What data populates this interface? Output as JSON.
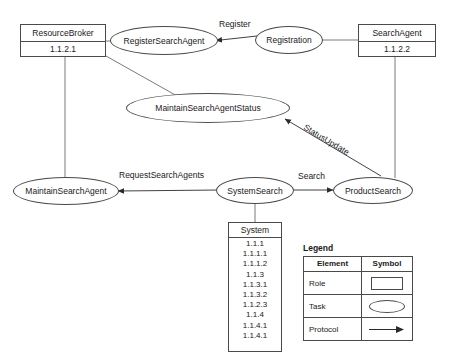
{
  "diagram": {
    "background_color": "#ffffff",
    "line_color": "#4a4a4a",
    "text_color": "#1a1a1a"
  },
  "roles": [
    {
      "name": "ResourceBroker",
      "id": "1.1.2.1"
    },
    {
      "name": "SearchAgent",
      "id": "1.1.2.2"
    }
  ],
  "tasks": [
    {
      "label": "RegisterSearchAgent"
    },
    {
      "label": "Registration"
    },
    {
      "label": "MaintainSearchAgentStatus"
    },
    {
      "label": "MaintainSearchAgent"
    },
    {
      "label": "SystemSearch"
    },
    {
      "label": "ProductSearch"
    }
  ],
  "protocols": [
    {
      "label": "Register",
      "from": "Registration",
      "to": "RegisterSearchAgent"
    },
    {
      "label": "StatusUpdate",
      "from": "ProductSearch",
      "to": "MaintainSearchAgentStatus"
    },
    {
      "label": "RequestSearchAgents",
      "from": "SystemSearch",
      "to": "MaintainSearchAgent"
    },
    {
      "label": "Search",
      "from": "SystemSearch",
      "to": "ProductSearch"
    }
  ],
  "system_box": {
    "header": "System",
    "items": [
      "1.1.1",
      "1.1.1.1",
      "1.1.1.2",
      "1.1.3",
      "1.1.3.1",
      "1.1.3.2",
      "1.1.2.3",
      "1.1.4",
      "1.1.4.1",
      "1.1.4.1"
    ]
  },
  "legend": {
    "title": "Legend",
    "headers": {
      "element": "Element",
      "symbol": "Symbol"
    },
    "rows": [
      {
        "element": "Role",
        "symbol": "rectangle"
      },
      {
        "element": "Task",
        "symbol": "ellipse"
      },
      {
        "element": "Protocol",
        "symbol": "arrow"
      }
    ]
  }
}
